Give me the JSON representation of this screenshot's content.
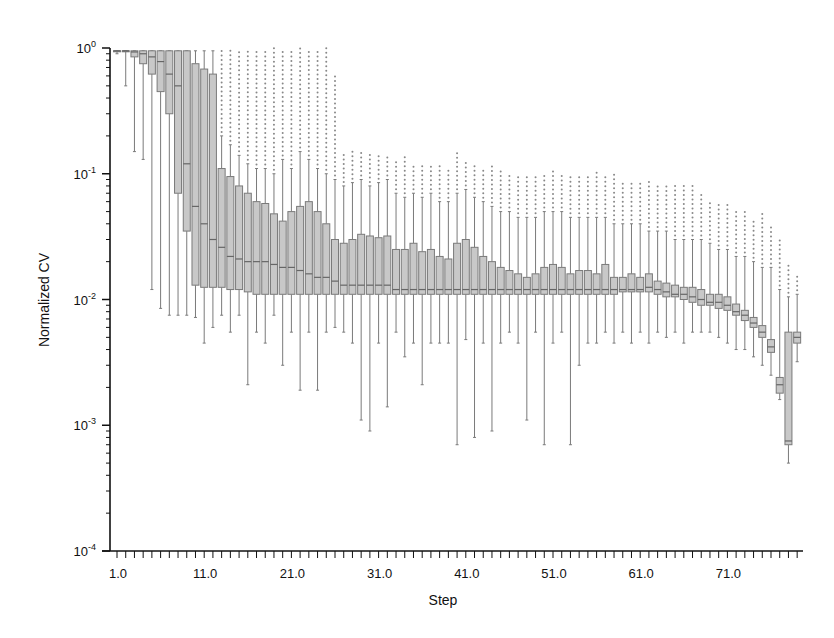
{
  "chart_data": {
    "type": "box",
    "title": "",
    "xlabel": "Step",
    "ylabel": "Normalized CV",
    "yscale": "log",
    "ylim": [
      0.0001,
      1
    ],
    "y_tick_labels": [
      "10^0",
      "10^-1",
      "10^-2",
      "10^-3",
      "10^-4"
    ],
    "x_tick_labels": [
      "1.0",
      "11.0",
      "21.0",
      "31.0",
      "41.0",
      "51.0",
      "61.0",
      "71.0"
    ],
    "x_range": [
      1,
      79
    ],
    "grid": false,
    "legend": null,
    "box_color": "#c8c8c8",
    "box_edge_color": "#7a7a7a",
    "note": "approximate box statistics per step read from log-scale pixel positions: [whisker_low, q1, median, q3, whisker_high]",
    "boxes": [
      [
        0.9,
        0.95,
        0.95,
        0.95,
        0.95
      ],
      [
        0.5,
        0.95,
        0.95,
        0.95,
        0.95
      ],
      [
        0.15,
        0.85,
        0.93,
        0.95,
        0.95
      ],
      [
        0.13,
        0.75,
        0.9,
        0.95,
        0.95
      ],
      [
        0.012,
        0.62,
        0.85,
        0.95,
        0.95
      ],
      [
        0.0085,
        0.45,
        0.78,
        0.95,
        0.95
      ],
      [
        0.0075,
        0.3,
        0.62,
        0.95,
        0.95
      ],
      [
        0.0075,
        0.07,
        0.5,
        0.95,
        0.95
      ],
      [
        0.0075,
        0.035,
        0.12,
        0.95,
        0.95
      ],
      [
        0.0072,
        0.013,
        0.055,
        0.75,
        0.95
      ],
      [
        0.0045,
        0.0125,
        0.04,
        0.68,
        0.95
      ],
      [
        0.006,
        0.0125,
        0.03,
        0.62,
        0.95
      ],
      [
        0.0075,
        0.0125,
        0.026,
        0.11,
        0.2
      ],
      [
        0.0055,
        0.012,
        0.022,
        0.095,
        0.17
      ],
      [
        0.0075,
        0.012,
        0.021,
        0.08,
        0.14
      ],
      [
        0.0021,
        0.0115,
        0.02,
        0.07,
        0.12
      ],
      [
        0.0055,
        0.011,
        0.02,
        0.06,
        0.11
      ],
      [
        0.0045,
        0.011,
        0.02,
        0.058,
        0.11
      ],
      [
        0.0075,
        0.011,
        0.019,
        0.048,
        0.1
      ],
      [
        0.003,
        0.011,
        0.018,
        0.042,
        0.13
      ],
      [
        0.0055,
        0.011,
        0.018,
        0.05,
        0.11
      ],
      [
        0.0019,
        0.011,
        0.017,
        0.055,
        0.15
      ],
      [
        0.0055,
        0.011,
        0.016,
        0.06,
        0.13
      ],
      [
        0.0019,
        0.011,
        0.015,
        0.05,
        0.11
      ],
      [
        0.0055,
        0.011,
        0.015,
        0.04,
        0.1
      ],
      [
        0.006,
        0.011,
        0.014,
        0.03,
        0.09
      ],
      [
        0.0055,
        0.011,
        0.013,
        0.028,
        0.08
      ],
      [
        0.0045,
        0.011,
        0.013,
        0.03,
        0.085
      ],
      [
        0.0011,
        0.011,
        0.013,
        0.033,
        0.09
      ],
      [
        0.0009,
        0.011,
        0.013,
        0.032,
        0.08
      ],
      [
        0.0045,
        0.011,
        0.013,
        0.031,
        0.085
      ],
      [
        0.0014,
        0.011,
        0.013,
        0.032,
        0.09
      ],
      [
        0.0055,
        0.011,
        0.012,
        0.025,
        0.07
      ],
      [
        0.0035,
        0.011,
        0.012,
        0.025,
        0.065
      ],
      [
        0.0045,
        0.011,
        0.012,
        0.028,
        0.07
      ],
      [
        0.0021,
        0.011,
        0.012,
        0.024,
        0.065
      ],
      [
        0.0045,
        0.011,
        0.012,
        0.025,
        0.07
      ],
      [
        0.0045,
        0.011,
        0.012,
        0.022,
        0.06
      ],
      [
        0.0045,
        0.011,
        0.012,
        0.021,
        0.06
      ],
      [
        0.0007,
        0.011,
        0.012,
        0.028,
        0.07
      ],
      [
        0.0048,
        0.011,
        0.012,
        0.03,
        0.075
      ],
      [
        0.0008,
        0.011,
        0.012,
        0.026,
        0.065
      ],
      [
        0.0045,
        0.011,
        0.012,
        0.022,
        0.06
      ],
      [
        0.0009,
        0.011,
        0.012,
        0.02,
        0.055
      ],
      [
        0.0045,
        0.011,
        0.012,
        0.018,
        0.05
      ],
      [
        0.0055,
        0.011,
        0.012,
        0.017,
        0.05
      ],
      [
        0.0045,
        0.011,
        0.012,
        0.016,
        0.045
      ],
      [
        0.0011,
        0.011,
        0.012,
        0.015,
        0.045
      ],
      [
        0.0055,
        0.011,
        0.012,
        0.016,
        0.045
      ],
      [
        0.0007,
        0.011,
        0.012,
        0.018,
        0.05
      ],
      [
        0.0045,
        0.011,
        0.012,
        0.019,
        0.05
      ],
      [
        0.0055,
        0.011,
        0.012,
        0.018,
        0.05
      ],
      [
        0.0007,
        0.011,
        0.012,
        0.016,
        0.045
      ],
      [
        0.003,
        0.011,
        0.012,
        0.017,
        0.045
      ],
      [
        0.0045,
        0.011,
        0.012,
        0.017,
        0.045
      ],
      [
        0.0045,
        0.011,
        0.012,
        0.016,
        0.045
      ],
      [
        0.0055,
        0.011,
        0.012,
        0.019,
        0.045
      ],
      [
        0.0045,
        0.011,
        0.012,
        0.015,
        0.04
      ],
      [
        0.0055,
        0.0115,
        0.012,
        0.015,
        0.04
      ],
      [
        0.0045,
        0.0115,
        0.012,
        0.016,
        0.04
      ],
      [
        0.0055,
        0.0115,
        0.012,
        0.015,
        0.04
      ],
      [
        0.0045,
        0.0115,
        0.0125,
        0.016,
        0.035
      ],
      [
        0.0055,
        0.011,
        0.012,
        0.014,
        0.035
      ],
      [
        0.005,
        0.0105,
        0.0115,
        0.0135,
        0.035
      ],
      [
        0.0055,
        0.0105,
        0.011,
        0.013,
        0.03
      ],
      [
        0.0045,
        0.01,
        0.011,
        0.0125,
        0.03
      ],
      [
        0.0055,
        0.0095,
        0.0105,
        0.0125,
        0.03
      ],
      [
        0.0055,
        0.009,
        0.01,
        0.012,
        0.03
      ],
      [
        0.0055,
        0.009,
        0.0095,
        0.011,
        0.028
      ],
      [
        0.005,
        0.0085,
        0.0095,
        0.011,
        0.025
      ],
      [
        0.0045,
        0.0082,
        0.009,
        0.0105,
        0.025
      ],
      [
        0.004,
        0.0075,
        0.008,
        0.0092,
        0.022
      ],
      [
        0.004,
        0.0068,
        0.0075,
        0.0082,
        0.022
      ],
      [
        0.0035,
        0.006,
        0.0065,
        0.0072,
        0.02
      ],
      [
        0.003,
        0.005,
        0.0055,
        0.0062,
        0.018
      ],
      [
        0.0025,
        0.0038,
        0.0042,
        0.0048,
        0.018
      ],
      [
        0.0016,
        0.0018,
        0.0021,
        0.0024,
        0.012
      ],
      [
        0.0005,
        0.0007,
        0.00075,
        0.0055,
        0.0105
      ],
      [
        0.0032,
        0.0045,
        0.005,
        0.0055,
        0.011
      ]
    ],
    "outlier_high_caps": [
      1.0,
      1.0,
      1.0,
      1.0,
      1.0,
      1.0,
      1.0,
      1.0,
      1.0,
      1.0,
      1.0,
      1.0,
      1.0,
      1.0,
      1.0,
      1.0,
      1.0,
      1.0,
      1.0,
      1.0,
      1.0,
      1.0,
      1.0,
      1.0,
      1.0,
      0.6,
      0.15,
      0.15,
      0.15,
      0.15,
      0.14,
      0.14,
      0.13,
      0.14,
      0.12,
      0.12,
      0.12,
      0.12,
      0.11,
      0.15,
      0.13,
      0.12,
      0.11,
      0.12,
      0.11,
      0.1,
      0.1,
      0.1,
      0.1,
      0.1,
      0.11,
      0.1,
      0.1,
      0.1,
      0.1,
      0.11,
      0.1,
      0.1,
      0.09,
      0.09,
      0.09,
      0.09,
      0.08,
      0.08,
      0.08,
      0.08,
      0.08,
      0.07,
      0.06,
      0.06,
      0.06,
      0.05,
      0.05,
      0.045,
      0.05,
      0.04,
      0.03,
      0.02,
      0.016
    ]
  }
}
